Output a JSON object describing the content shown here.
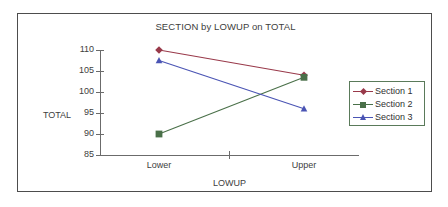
{
  "chart_data": {
    "type": "line",
    "title": "SECTION by LOWUP on TOTAL",
    "xlabel": "LOWUP",
    "ylabel": "TOTAL",
    "categories": [
      "Lower",
      "Upper"
    ],
    "ylim": [
      85,
      110
    ],
    "yticks": [
      85,
      90,
      95,
      100,
      105,
      110
    ],
    "ytick_labels": [
      "85",
      "90",
      "95",
      "100",
      "105",
      "110"
    ],
    "grid": false,
    "legend_position": "right",
    "series": [
      {
        "name": "Section 1",
        "values": [
          110.0,
          104.0
        ],
        "color": "#99394a",
        "marker": "diamond"
      },
      {
        "name": "Section 2",
        "values": [
          90.0,
          103.5
        ],
        "color": "#4a7049",
        "marker": "square"
      },
      {
        "name": "Section 3",
        "values": [
          107.5,
          96.0
        ],
        "color": "#4a54b4",
        "marker": "triangle"
      }
    ]
  },
  "legend": {
    "entries": [
      {
        "label": "Section 1"
      },
      {
        "label": "Section 2"
      },
      {
        "label": "Section 3"
      }
    ]
  },
  "axes": {
    "y_title": "TOTAL",
    "x_title": "LOWUP",
    "x_categories": [
      "Lower",
      "Upper"
    ],
    "y_tick_labels": [
      "110",
      "105",
      "100",
      "95",
      "90",
      "85"
    ]
  },
  "colors": {
    "series1": "#99394a",
    "series2": "#4a7049",
    "series3": "#4a54b4",
    "axis": "#6b6b6b",
    "frame": "#4d4d4d",
    "legend_border": "#5a7a5a",
    "text": "#404040"
  }
}
